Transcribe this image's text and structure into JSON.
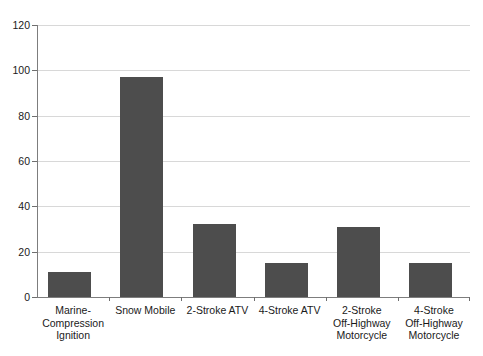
{
  "chart_data": {
    "type": "bar",
    "title": "",
    "subtitle": "",
    "xlabel": "",
    "ylabel": "",
    "ylim": [
      0,
      120
    ],
    "yticks": [
      0,
      20,
      40,
      60,
      80,
      100,
      120
    ],
    "ytick_labels": [
      "0",
      "20",
      "40",
      "60",
      "80",
      "100",
      "120"
    ],
    "grid": true,
    "legend": false,
    "legend_position": "none",
    "bar_color": "#4d4d4d",
    "gridline_color": "#d8d8d8",
    "axis_color": "#7d7d7d",
    "background_color": "#ffffff",
    "categories": [
      "Marine-\nCompression\nIgnition",
      "Snow Mobile",
      "2-Stroke ATV",
      "4-Stroke ATV",
      "2-Stroke\nOff-Highway\nMotorcycle",
      "4-Stroke\nOff-Highway\nMotorcycle"
    ],
    "values": [
      11,
      97,
      32,
      15,
      31,
      15
    ]
  }
}
